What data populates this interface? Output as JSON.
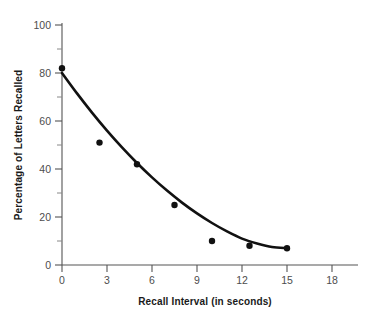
{
  "chart_data": {
    "type": "scatter",
    "title": "",
    "xlabel": "Recall Interval (in seconds)",
    "ylabel": "Percentage of Letters Recalled",
    "xlim": [
      0,
      19.5
    ],
    "ylim": [
      0,
      103
    ],
    "grid": false,
    "legend": "none",
    "x_ticks": [
      0,
      3,
      6,
      9,
      12,
      15,
      18
    ],
    "x_tick_labels": [
      "0",
      "3",
      "6",
      "9",
      "12",
      "15",
      "18"
    ],
    "y_ticks": [
      0,
      20,
      40,
      60,
      80,
      100
    ],
    "y_tick_labels": [
      "0",
      "20",
      "40",
      "60",
      "80",
      "100"
    ],
    "y_minor_ticks": [
      10,
      30,
      50,
      70,
      90
    ],
    "x": [
      0,
      2.5,
      5,
      7.5,
      10,
      12.5,
      15
    ],
    "values": [
      82,
      51,
      42,
      25,
      10,
      8,
      7
    ],
    "points": [
      {
        "x": 0,
        "y": 82
      },
      {
        "x": 2.5,
        "y": 51
      },
      {
        "x": 5,
        "y": 42
      },
      {
        "x": 7.5,
        "y": 25
      },
      {
        "x": 10,
        "y": 10
      },
      {
        "x": 12.5,
        "y": 8
      },
      {
        "x": 15,
        "y": 7
      }
    ],
    "fit_curve": {
      "name": "fitted forgetting curve",
      "x": [
        0,
        1,
        2,
        3,
        4,
        5,
        6,
        7,
        8,
        9,
        10,
        11,
        12,
        13,
        14,
        15
      ],
      "y": [
        80,
        71.5,
        63.5,
        56,
        49,
        42.5,
        36.5,
        31,
        26,
        21.5,
        17.5,
        14,
        11,
        9,
        7.5,
        7
      ]
    },
    "colors": {
      "point": "#111111",
      "curve": "#111111",
      "axis": "#555555",
      "tick_label": "#4d4d4d",
      "axis_title": "#1a1a1a",
      "background": "#ffffff"
    }
  },
  "figure": {
    "x_axis_title": "Recall Interval (in seconds)",
    "y_axis_title": "Percentage of Letters Recalled",
    "x_tick_labels": [
      "0",
      "3",
      "6",
      "9",
      "12",
      "15",
      "18"
    ],
    "y_tick_labels": [
      "100",
      "80",
      "60",
      "40",
      "20",
      "0"
    ]
  }
}
